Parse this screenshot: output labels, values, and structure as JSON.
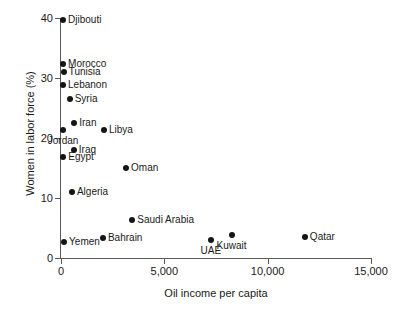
{
  "chart_data": {
    "type": "scatter",
    "title": "",
    "xlabel": "Oil income per capita",
    "ylabel": "Women in labor force (%)",
    "xlim": [
      0,
      15000
    ],
    "ylim": [
      0,
      41
    ],
    "grid": false,
    "legend": "none",
    "xticks": [
      {
        "value": 0,
        "label": "0"
      },
      {
        "value": 5000,
        "label": "5,000"
      },
      {
        "value": 10000,
        "label": "10,000"
      },
      {
        "value": 15000,
        "label": "15,000"
      }
    ],
    "yticks": [
      {
        "value": 0,
        "label": "0"
      },
      {
        "value": 10,
        "label": "10"
      },
      {
        "value": 20,
        "label": "20"
      },
      {
        "value": 30,
        "label": "30"
      },
      {
        "value": 40,
        "label": "40"
      }
    ],
    "points": [
      {
        "name": "Djibouti",
        "x": 100,
        "y": 39.7,
        "label": "Djibouti",
        "pos": "right"
      },
      {
        "name": "Morocco",
        "x": 100,
        "y": 32.3,
        "label": "Morocco",
        "pos": "right"
      },
      {
        "name": "Tunisia",
        "x": 130,
        "y": 31.0,
        "label": "Tunisia",
        "pos": "right"
      },
      {
        "name": "Lebanon",
        "x": 100,
        "y": 28.8,
        "label": "Lebanon",
        "pos": "right"
      },
      {
        "name": "Syria",
        "x": 420,
        "y": 26.5,
        "label": "Syria",
        "pos": "right"
      },
      {
        "name": "Iran",
        "x": 640,
        "y": 22.5,
        "label": "Iran",
        "pos": "right"
      },
      {
        "name": "Jordan",
        "x": 100,
        "y": 21.4,
        "label": "Jordan",
        "pos": "below"
      },
      {
        "name": "Libya",
        "x": 2080,
        "y": 21.4,
        "label": "Libya",
        "pos": "right"
      },
      {
        "name": "Iraq",
        "x": 620,
        "y": 18.0,
        "label": "Iraq",
        "pos": "right"
      },
      {
        "name": "Egypt",
        "x": 110,
        "y": 16.8,
        "label": "Egypt",
        "pos": "right"
      },
      {
        "name": "Oman",
        "x": 3150,
        "y": 15.0,
        "label": "Oman",
        "pos": "right"
      },
      {
        "name": "Algeria",
        "x": 530,
        "y": 11.0,
        "label": "Algeria",
        "pos": "right"
      },
      {
        "name": "Saudi Arabia",
        "x": 3450,
        "y": 6.3,
        "label": "Saudi Arabia",
        "pos": "right"
      },
      {
        "name": "Bahrain",
        "x": 2030,
        "y": 3.4,
        "label": "Bahrain",
        "pos": "right"
      },
      {
        "name": "Yemen",
        "x": 150,
        "y": 2.7,
        "label": "Yemen",
        "pos": "right"
      },
      {
        "name": "UAE",
        "x": 7250,
        "y": 3.0,
        "label": "UAE",
        "pos": "below"
      },
      {
        "name": "Kuwait",
        "x": 8250,
        "y": 3.9,
        "label": "Kuwait",
        "pos": "below"
      },
      {
        "name": "Qatar",
        "x": 11800,
        "y": 3.5,
        "label": "Qatar",
        "pos": "right"
      }
    ],
    "marker_color": "#151515",
    "axis_color": "#5a5a5a"
  }
}
